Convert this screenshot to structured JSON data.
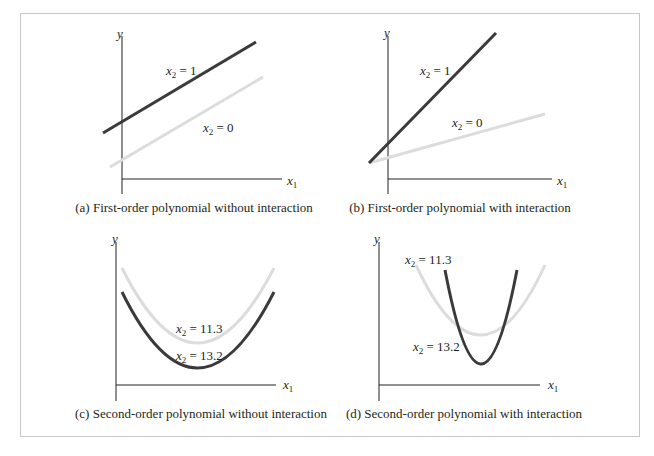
{
  "figure": {
    "panels": [
      {
        "id": "a",
        "caption": "(a) First-order polynomial without interaction",
        "y_label": "y",
        "x_label": "x",
        "x_label_sub": "1",
        "curves": [
          {
            "label_var": "x",
            "label_sub": "2",
            "label_eq": " = 1",
            "shade": "dark",
            "type": "line"
          },
          {
            "label_var": "x",
            "label_sub": "2",
            "label_eq": " = 0",
            "shade": "light",
            "type": "line"
          }
        ]
      },
      {
        "id": "b",
        "caption": "(b) First-order polynomial with interaction",
        "y_label": "y",
        "x_label": "x",
        "x_label_sub": "1",
        "curves": [
          {
            "label_var": "x",
            "label_sub": "2",
            "label_eq": " = 1",
            "shade": "dark",
            "type": "line"
          },
          {
            "label_var": "x",
            "label_sub": "2",
            "label_eq": " = 0",
            "shade": "light",
            "type": "line"
          }
        ]
      },
      {
        "id": "c",
        "caption": "(c) Second-order polynomial without interaction",
        "y_label": "y",
        "x_label": "x",
        "x_label_sub": "1",
        "curves": [
          {
            "label_var": "x",
            "label_sub": "2",
            "label_eq": " = 11.3",
            "shade": "light",
            "type": "parabola"
          },
          {
            "label_var": "x",
            "label_sub": "2",
            "label_eq": " = 13.2",
            "shade": "dark",
            "type": "parabola"
          }
        ]
      },
      {
        "id": "d",
        "caption": "(d) Second-order polynomial with interaction",
        "y_label": "y",
        "x_label": "x",
        "x_label_sub": "1",
        "curves": [
          {
            "label_var": "x",
            "label_sub": "2",
            "label_eq": " = 11.3",
            "shade": "light",
            "type": "parabola"
          },
          {
            "label_var": "x",
            "label_sub": "2",
            "label_eq": " = 13.2",
            "shade": "dark",
            "type": "parabola"
          }
        ]
      }
    ],
    "colors": {
      "dark": "#3a3a3c",
      "light": "#dcdcdc",
      "axis": "#231f20",
      "frame": "#c8c8c8"
    }
  }
}
